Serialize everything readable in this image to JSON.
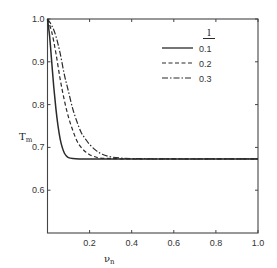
{
  "chart_data": {
    "type": "line",
    "title": "",
    "xlabel": "ν",
    "xlabel_sub": "n",
    "ylabel": "T",
    "ylabel_sub": "m",
    "xlim": [
      0.0,
      1.0
    ],
    "ylim": [
      0.5,
      1.0
    ],
    "x_ticks": [
      0.2,
      0.4,
      0.6,
      0.8,
      1.0
    ],
    "x_tick_labels": [
      "0.2",
      "0.4",
      "0.6",
      "0.8",
      "1.0"
    ],
    "y_ticks": [
      0.6,
      0.7,
      0.8,
      0.9,
      1.0
    ],
    "y_tick_labels": [
      "0.6",
      "0.7",
      "0.8",
      "0.9",
      "1.0"
    ],
    "grid": false,
    "legend": {
      "title": "l",
      "position": "upper right",
      "entries": [
        "0.1",
        "0.2",
        "0.3"
      ]
    },
    "series": [
      {
        "name": "0.1",
        "style": "solid",
        "x": [
          0.0,
          0.01,
          0.02,
          0.03,
          0.04,
          0.05,
          0.06,
          0.07,
          0.08,
          0.09,
          0.1,
          0.12,
          0.15,
          0.2,
          0.4,
          0.6,
          0.8,
          1.0
        ],
        "values": [
          1.0,
          0.96,
          0.9,
          0.84,
          0.79,
          0.75,
          0.72,
          0.7,
          0.687,
          0.68,
          0.676,
          0.674,
          0.673,
          0.673,
          0.673,
          0.673,
          0.673,
          0.673
        ]
      },
      {
        "name": "0.2",
        "style": "dashed",
        "x": [
          0.0,
          0.02,
          0.04,
          0.06,
          0.08,
          0.1,
          0.12,
          0.14,
          0.16,
          0.18,
          0.2,
          0.22,
          0.25,
          0.3,
          0.4,
          0.6,
          0.8,
          1.0
        ],
        "values": [
          1.0,
          0.97,
          0.92,
          0.86,
          0.81,
          0.77,
          0.74,
          0.715,
          0.7,
          0.69,
          0.683,
          0.679,
          0.675,
          0.674,
          0.673,
          0.673,
          0.673,
          0.673
        ]
      },
      {
        "name": "0.3",
        "style": "dashdot",
        "x": [
          0.0,
          0.02,
          0.04,
          0.06,
          0.08,
          0.1,
          0.12,
          0.14,
          0.16,
          0.18,
          0.2,
          0.23,
          0.26,
          0.3,
          0.35,
          0.4,
          0.6,
          0.8,
          1.0
        ],
        "values": [
          1.0,
          0.985,
          0.96,
          0.92,
          0.87,
          0.83,
          0.79,
          0.76,
          0.735,
          0.72,
          0.707,
          0.693,
          0.684,
          0.678,
          0.675,
          0.674,
          0.673,
          0.673,
          0.673
        ]
      }
    ]
  }
}
